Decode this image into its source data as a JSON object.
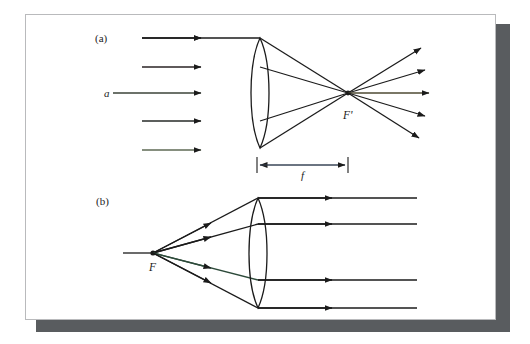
{
  "figure": {
    "background_color": "#ffffff",
    "card_color": "#ffffff",
    "card_border_color": "#b9babc",
    "shadow_color": "#595c5f",
    "ink_color": "#1b1b1b",
    "panels": [
      {
        "id": "panel-a",
        "label": "(a)",
        "label_x": 70,
        "label_y": 26,
        "description": "Parallel rays converging through a converging lens to the focal point F prime, then diverging"
      },
      {
        "id": "panel-b",
        "label": "(b)",
        "label_x": 71,
        "label_y": 189,
        "description": "Rays from focal point F refracted by a converging lens into parallel rays"
      }
    ],
    "point_labels": [
      {
        "id": "axis-ray-label-a",
        "text": "a",
        "x": 79,
        "y": 80,
        "style": "italic"
      },
      {
        "id": "focal-point-label-a",
        "text": "F'",
        "x": 318,
        "y": 98,
        "style": "italic"
      },
      {
        "id": "focal-point-label-b",
        "text": "F",
        "x": 124,
        "y": 250,
        "style": "italic"
      },
      {
        "id": "focal-length-label",
        "text": "f",
        "x": 275,
        "y": 157,
        "style": "italic"
      }
    ],
    "ray_colors": {
      "ink": "#1b1b1b",
      "red_tint": "#d14b52",
      "blue_tint": "#5a58c8",
      "green_tint": "#4e8f63",
      "teal_tint": "#3f7f86"
    },
    "panel_a": {
      "lens": {
        "cx": 235,
        "cy": 79,
        "half_height": 55,
        "half_width": 7
      },
      "focal_point": {
        "x": 323,
        "y": 81
      },
      "incoming_rays": [
        {
          "y": 24,
          "x_start": 117,
          "x_end": 235,
          "tint": "none"
        },
        {
          "y": 53,
          "x_start": 117,
          "x_end": 235,
          "tint": "red"
        },
        {
          "y": 79,
          "x_start": 88,
          "x_end": 235,
          "tint": "blue"
        },
        {
          "y": 107,
          "x_start": 117,
          "x_end": 235,
          "tint": "green"
        },
        {
          "y": 136,
          "x_start": 117,
          "x_end": 235,
          "tint": "violet-green"
        }
      ],
      "outgoing_rays": [
        {
          "x_end": 400,
          "y_end": 36
        },
        {
          "x_end": 404,
          "y_end": 58
        },
        {
          "x_end": 407,
          "y_end": 81
        },
        {
          "x_end": 404,
          "y_end": 104
        },
        {
          "x_end": 398,
          "y_end": 126
        }
      ],
      "focal_length_bar": {
        "x_left": 232,
        "x_right": 323,
        "y": 151
      }
    },
    "panel_b": {
      "lens": {
        "cx": 233,
        "cy": 239,
        "half_height": 57,
        "half_width": 7
      },
      "focal_point": {
        "x": 128,
        "y": 239
      },
      "outgoing_rays": [
        {
          "y": 184,
          "x_start": 233,
          "x_end": 392,
          "tint": "none"
        },
        {
          "y": 210,
          "x_start": 233,
          "x_end": 392,
          "tint": "none"
        },
        {
          "y": 239,
          "x_start": 98,
          "x_end": 400,
          "tint": "blue"
        },
        {
          "y": 266,
          "x_start": 233,
          "x_end": 392,
          "tint": "none"
        },
        {
          "y": 293,
          "x_start": 233,
          "x_end": 392,
          "tint": "none"
        }
      ]
    }
  }
}
